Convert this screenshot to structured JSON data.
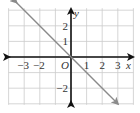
{
  "chart_data": {
    "type": "line",
    "title": "",
    "xlabel": "x",
    "ylabel": "y",
    "origin_label": "O",
    "xlim": [
      -4,
      4
    ],
    "ylim": [
      -3,
      3
    ],
    "grid": true,
    "x_tick_labels": [
      "−3",
      "−2",
      "1",
      "2",
      "3"
    ],
    "x_ticks": [
      -3,
      -2,
      1,
      2,
      3
    ],
    "y_tick_labels": [
      "2",
      "1",
      "−2"
    ],
    "y_ticks": [
      2,
      1,
      -2
    ],
    "series": [
      {
        "name": "y = -x",
        "equation": "y = -x",
        "x": [
          -3.5,
          3
        ],
        "y": [
          3.5,
          -3
        ],
        "color": "#8a8a8a",
        "arrows": "both"
      }
    ],
    "axis_color": "#111111",
    "grid_color": "#cccccc"
  }
}
